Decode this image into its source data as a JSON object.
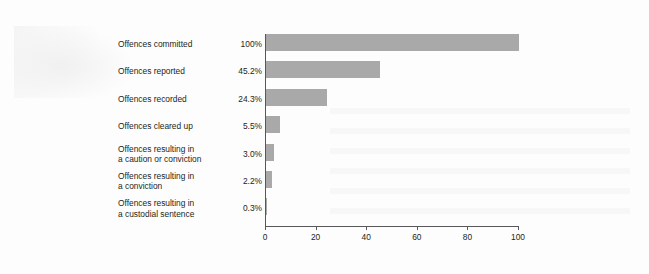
{
  "chart_data": {
    "type": "bar",
    "orientation": "horizontal",
    "title": "",
    "xlabel": "",
    "ylabel": "",
    "xlim": [
      0,
      100
    ],
    "xticks": [
      "0",
      "20",
      "40",
      "60",
      "80",
      "100"
    ],
    "grid": false,
    "legend": null,
    "bar_color": "#a9a9a9",
    "categories": [
      "Offences committed",
      "Offences reported",
      "Offences recorded",
      "Offences cleared up",
      "Offences resulting in a caution or conviction",
      "Offences resulting in a conviction",
      "Offences resulting in a custodial sentence"
    ],
    "values": [
      100,
      45.2,
      24.3,
      5.5,
      3.0,
      2.2,
      0.3
    ],
    "data_labels": [
      "100%",
      "45.2%",
      "24.3%",
      "5.5%",
      "3.0%",
      "2.2%",
      "0.3%"
    ],
    "bars": [
      {
        "label_line1": "Offences committed",
        "label_line2": "",
        "value": 100,
        "data_label": "100%"
      },
      {
        "label_line1": "Offences reported",
        "label_line2": "",
        "value": 45.2,
        "data_label": "45.2%"
      },
      {
        "label_line1": "Offences recorded",
        "label_line2": "",
        "value": 24.3,
        "data_label": "24.3%"
      },
      {
        "label_line1": "Offences cleared up",
        "label_line2": "",
        "value": 5.5,
        "data_label": "5.5%"
      },
      {
        "label_line1": "Offences resulting in",
        "label_line2": "a caution or conviction",
        "value": 3.0,
        "data_label": "3.0%"
      },
      {
        "label_line1": "Offences resulting in",
        "label_line2": "a conviction",
        "value": 2.2,
        "data_label": "2.2%"
      },
      {
        "label_line1": "Offences resulting in",
        "label_line2": "a custodial sentence",
        "value": 0.3,
        "data_label": "0.3%"
      }
    ]
  },
  "page": {
    "background_color": "#fdfdfd",
    "axis_color": "#58585a",
    "text_color": "#231f20"
  }
}
